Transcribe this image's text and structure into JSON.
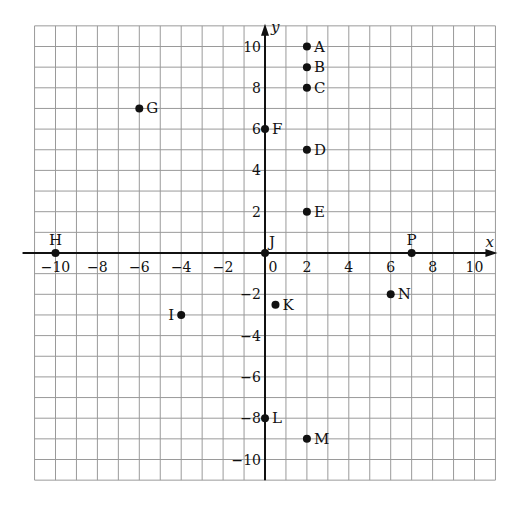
{
  "header_fragment": "graph",
  "axes": {
    "x_label": "x",
    "y_label": "y",
    "xlim": [
      -11,
      11
    ],
    "ylim": [
      -11,
      11
    ]
  },
  "x_ticks": [
    -10,
    -8,
    -6,
    -4,
    -2,
    0,
    2,
    4,
    6,
    8,
    10
  ],
  "y_ticks": [
    10,
    8,
    6,
    4,
    2,
    -2,
    -4,
    -6,
    -8,
    -10
  ],
  "points": [
    {
      "name": "A",
      "x": 2,
      "y": 10
    },
    {
      "name": "B",
      "x": 2,
      "y": 9
    },
    {
      "name": "C",
      "x": 2,
      "y": 8
    },
    {
      "name": "D",
      "x": 2,
      "y": 5
    },
    {
      "name": "E",
      "x": 2,
      "y": 2
    },
    {
      "name": "F",
      "x": 0,
      "y": 6
    },
    {
      "name": "G",
      "x": -6,
      "y": 7
    },
    {
      "name": "H",
      "x": -10,
      "y": 0
    },
    {
      "name": "I",
      "x": -4,
      "y": -3
    },
    {
      "name": "J",
      "x": 0,
      "y": 0
    },
    {
      "name": "K",
      "x": 0.5,
      "y": -2.5
    },
    {
      "name": "L",
      "x": 0,
      "y": -8
    },
    {
      "name": "M",
      "x": 2,
      "y": -9
    },
    {
      "name": "N",
      "x": 6,
      "y": -2
    },
    {
      "name": "P",
      "x": 7,
      "y": 0
    }
  ],
  "chart_data": {
    "type": "scatter",
    "title": "",
    "xlabel": "x",
    "ylabel": "y",
    "xlim": [
      -11,
      11
    ],
    "ylim": [
      -11,
      11
    ],
    "grid": true,
    "series": [
      {
        "name": "points",
        "labels": [
          "A",
          "B",
          "C",
          "D",
          "E",
          "F",
          "G",
          "H",
          "I",
          "J",
          "K",
          "L",
          "M",
          "N",
          "P"
        ],
        "x": [
          2,
          2,
          2,
          2,
          2,
          0,
          -6,
          -10,
          -4,
          0,
          0.5,
          0,
          2,
          6,
          7
        ],
        "y": [
          10,
          9,
          8,
          5,
          2,
          6,
          7,
          0,
          -3,
          0,
          -2.5,
          -8,
          -9,
          -2,
          0
        ]
      }
    ]
  }
}
